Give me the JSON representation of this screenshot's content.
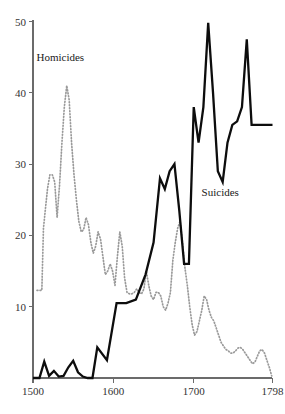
{
  "chart_data": {
    "type": "line",
    "title": "",
    "xlabel": "",
    "ylabel": "",
    "xlim": [
      1500,
      1798
    ],
    "ylim": [
      0,
      50
    ],
    "grid": false,
    "legend_position": "inline-annotations",
    "xticks": [
      1500,
      1600,
      1700,
      1798
    ],
    "xtick_labels": [
      "1500",
      "1600",
      "1700",
      "1798"
    ],
    "yticks": [
      10,
      20,
      30,
      40,
      50
    ],
    "ytick_labels": [
      "10",
      "20",
      "30",
      "40",
      "50"
    ],
    "annotations": [
      {
        "text": "Homicides",
        "x": 1534,
        "y": 44.5,
        "series": "homicides"
      },
      {
        "text": "Suicides",
        "x": 1733,
        "y": 25.5,
        "series": "suicides"
      }
    ],
    "series": [
      {
        "name": "Homicides",
        "style": "dotted",
        "color": "#9a9a9a",
        "x": [
          1505,
          1511,
          1513,
          1518,
          1521,
          1524,
          1527,
          1530,
          1533,
          1536,
          1539,
          1542,
          1545,
          1548,
          1551,
          1554,
          1557,
          1560,
          1563,
          1566,
          1569,
          1572,
          1575,
          1578,
          1581,
          1584,
          1587,
          1590,
          1593,
          1596,
          1599,
          1602,
          1605,
          1608,
          1611,
          1614,
          1617,
          1620,
          1623,
          1626,
          1629,
          1632,
          1635,
          1638,
          1641,
          1644,
          1647,
          1650,
          1653,
          1656,
          1659,
          1662,
          1665,
          1668,
          1671,
          1674,
          1677,
          1680,
          1683,
          1686,
          1689,
          1692,
          1695,
          1698,
          1701,
          1704,
          1707,
          1710,
          1713,
          1716,
          1719,
          1722,
          1725,
          1728,
          1731,
          1734,
          1737,
          1740,
          1743,
          1746,
          1749,
          1752,
          1755,
          1758,
          1761,
          1764,
          1767,
          1770,
          1773,
          1776,
          1779,
          1782,
          1785,
          1788,
          1791,
          1794,
          1797
        ],
        "values": [
          12.3,
          12.3,
          21.0,
          26.5,
          28.5,
          28.5,
          27.5,
          22.5,
          27.0,
          33.0,
          38.0,
          41.0,
          39.0,
          33.0,
          28.5,
          25.0,
          22.0,
          20.5,
          20.8,
          22.5,
          21.5,
          19.0,
          17.5,
          18.5,
          20.5,
          19.5,
          17.0,
          14.5,
          15.0,
          16.0,
          15.0,
          13.0,
          17.0,
          20.5,
          18.5,
          14.0,
          12.0,
          11.8,
          11.8,
          12.0,
          12.5,
          12.0,
          11.8,
          12.5,
          15.0,
          13.0,
          11.5,
          11.0,
          12.0,
          12.0,
          11.5,
          10.0,
          9.5,
          10.5,
          12.0,
          16.5,
          19.0,
          21.0,
          22.0,
          19.0,
          15.5,
          13.0,
          10.0,
          7.5,
          6.0,
          6.5,
          8.0,
          9.5,
          11.5,
          11.0,
          9.5,
          8.5,
          8.0,
          7.0,
          6.0,
          5.0,
          4.5,
          4.0,
          3.8,
          3.5,
          3.5,
          3.8,
          4.2,
          4.3,
          4.0,
          3.5,
          3.0,
          2.5,
          2.0,
          2.2,
          3.0,
          3.8,
          4.0,
          3.5,
          2.5,
          1.5,
          0.3
        ]
      },
      {
        "name": "Suicides",
        "style": "solid",
        "color": "#0d0d0d",
        "x": [
          1500,
          1508,
          1514,
          1520,
          1526,
          1532,
          1538,
          1544,
          1550,
          1556,
          1562,
          1568,
          1574,
          1580,
          1592,
          1604,
          1616,
          1628,
          1640,
          1650,
          1658,
          1664,
          1670,
          1676,
          1682,
          1688,
          1694,
          1700,
          1706,
          1712,
          1718,
          1724,
          1730,
          1736,
          1742,
          1748,
          1754,
          1760,
          1766,
          1772,
          1778,
          1784,
          1790,
          1798
        ],
        "values": [
          0.0,
          0.0,
          2.3,
          0.3,
          1.0,
          0.2,
          0.3,
          1.5,
          2.4,
          0.8,
          0.2,
          0.0,
          0.0,
          4.3,
          2.5,
          10.5,
          10.5,
          11.0,
          14.5,
          19.0,
          28.0,
          26.5,
          29.0,
          30.0,
          23.5,
          16.0,
          16.0,
          38.0,
          33.0,
          38.0,
          49.8,
          40.0,
          29.0,
          27.5,
          33.0,
          35.5,
          36.0,
          38.0,
          47.5,
          35.5,
          35.5,
          35.5,
          35.5,
          35.5
        ]
      }
    ]
  }
}
